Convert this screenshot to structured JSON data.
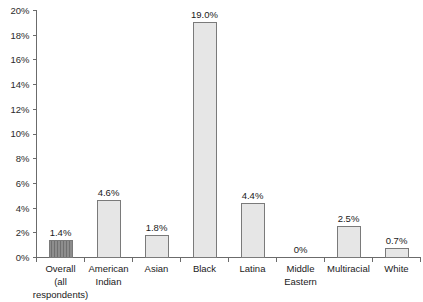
{
  "chart_data": {
    "type": "bar",
    "title": "",
    "subtitle": "",
    "xlabel": "",
    "ylabel": "",
    "ylim": [
      0,
      20
    ],
    "grid": false,
    "legend": "none",
    "y_tick_labels": [
      "0%",
      "2%",
      "4%",
      "6%",
      "8%",
      "10%",
      "12%",
      "14%",
      "16%",
      "18%",
      "20%"
    ],
    "y_tick_values": [
      0,
      2,
      4,
      6,
      8,
      10,
      12,
      14,
      16,
      18,
      20
    ],
    "categories": [
      "Overall (all respondents)",
      "American Indian",
      "Asian",
      "Black",
      "Latina",
      "Middle Eastern",
      "Multiracial",
      "White"
    ],
    "category_lines": [
      [
        "Overall",
        "(all",
        "respondents)"
      ],
      [
        "American",
        "Indian"
      ],
      [
        "Asian"
      ],
      [
        "Black"
      ],
      [
        "Latina"
      ],
      [
        "Middle",
        "Eastern"
      ],
      [
        "Multiracial"
      ],
      [
        "White"
      ]
    ],
    "values": [
      1.4,
      4.6,
      1.8,
      19.0,
      4.4,
      0,
      2.5,
      0.7
    ],
    "data_labels": [
      "1.4%",
      "4.6%",
      "1.8%",
      "19.0%",
      "4.4%",
      "0%",
      "2.5%",
      "0.7%"
    ],
    "bar_styles": [
      "hatched-dark",
      "plain-light",
      "plain-light",
      "plain-light",
      "plain-light",
      "none",
      "plain-light",
      "plain-light"
    ]
  },
  "colors": {
    "bar_fill_light": "#e6e6e6",
    "bar_fill_dark": "#8d8d8d",
    "bar_stroke": "#7a7a7a",
    "axis": "#6b6b6b",
    "text": "#1a1a1a",
    "background": "#ffffff"
  }
}
